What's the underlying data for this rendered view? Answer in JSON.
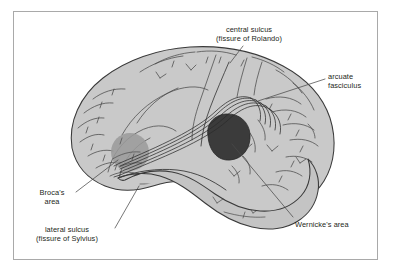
{
  "figure": {
    "kind": "anatomical-diagram",
    "frame_border_color": "#a9a9a9",
    "background_color": "#ffffff"
  },
  "colors": {
    "cortex_fill": "#c9c9c9",
    "temporal_fill": "#c4c4c4",
    "outline": "#3a3a3a",
    "sulci": "#4a4a4a",
    "brocas_fill": "#9a9a9a",
    "wernickes_fill": "#3b3b3b",
    "fasciculus_stroke": "#2b2b2b",
    "leader_line": "#4a4a4a",
    "text": "#231f20"
  },
  "labels": [
    {
      "id": "central-sulcus",
      "lines": [
        "central sulcus",
        "(fissure of Rolando)"
      ],
      "align": "center",
      "x": 216,
      "y": 25,
      "leader": {
        "x1": 243,
        "y1": 46,
        "x2": 230,
        "y2": 63
      }
    },
    {
      "id": "arcuate-fasciculus",
      "lines": [
        "arcuate",
        "fasciculus"
      ],
      "align": "left",
      "x": 328,
      "y": 72,
      "leader": {
        "x1": 325,
        "y1": 79,
        "x2": 258,
        "y2": 101
      }
    },
    {
      "id": "brocas-area",
      "lines": [
        "Broca's",
        "area"
      ],
      "align": "center",
      "x": 29,
      "y": 188,
      "leader": {
        "x1": 76,
        "y1": 192,
        "x2": 118,
        "y2": 160
      }
    },
    {
      "id": "lateral-sulcus",
      "lines": [
        "lateral sulcus",
        "(fissure of Sylvius)"
      ],
      "align": "center",
      "x": 20,
      "y": 225,
      "leader": {
        "x1": 115,
        "y1": 228,
        "x2": 139,
        "y2": 186
      }
    },
    {
      "id": "wernickes-area",
      "lines": [
        "Wernicke's area"
      ],
      "align": "left",
      "x": 295,
      "y": 220,
      "leader": {
        "x1": 293,
        "y1": 217,
        "x2": 232,
        "y2": 144
      }
    }
  ],
  "regions": [
    {
      "id": "brocas-area-region",
      "name": "Broca's area",
      "shade": "light-gray",
      "cx": 130,
      "cy": 152,
      "r": 19
    },
    {
      "id": "wernickes-area-region",
      "name": "Wernicke's area",
      "shade": "dark-gray",
      "cx": 228,
      "cy": 137,
      "r": 21
    },
    {
      "id": "arcuate-fasciculus-tract",
      "name": "arcuate fasciculus",
      "strands": 5
    }
  ]
}
